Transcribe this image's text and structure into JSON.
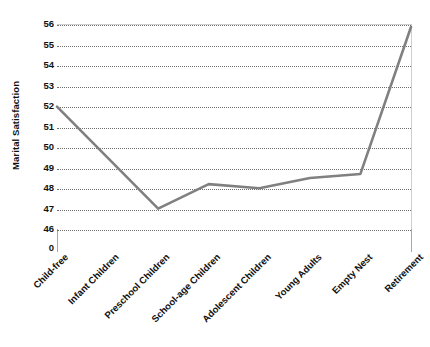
{
  "chart_data": {
    "type": "line",
    "title": "",
    "xlabel": "",
    "ylabel": "Marital Satisfaction",
    "categories": [
      "Child-free",
      "Infant Children",
      "Preschool Children",
      "School-age Children",
      "Adolescent Children",
      "Young Adults",
      "Empty Nest",
      "Retirement"
    ],
    "values": [
      52,
      49.5,
      47,
      48.2,
      48,
      48.5,
      48.7,
      55.9
    ],
    "series": [
      {
        "name": "Marital Satisfaction",
        "values": [
          52,
          49.5,
          47,
          48.2,
          48,
          48.5,
          48.7,
          55.9
        ]
      }
    ],
    "y_ticks": [
      0,
      46,
      47,
      48,
      49,
      50,
      51,
      52,
      53,
      54,
      55,
      56
    ],
    "ylim": [
      46,
      56
    ],
    "y_axis_break": true,
    "grid": true,
    "legend": false,
    "line_color": "#808080",
    "grid_color": "#6f6f6f",
    "axis_color": "#a8a8a8",
    "background_color": "#ffffff"
  }
}
